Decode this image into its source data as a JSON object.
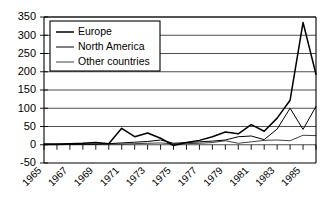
{
  "chart_data": {
    "type": "line",
    "title": "",
    "xlabel": "",
    "ylabel": "",
    "ylim": [
      -50,
      350
    ],
    "ytick_values": [
      -50,
      0,
      50,
      100,
      150,
      200,
      250,
      300,
      350
    ],
    "ytick_labels": [
      "-50",
      "0",
      "50",
      "100",
      "150",
      "200",
      "250",
      "300",
      "350"
    ],
    "grid": true,
    "legend_position": "upper left",
    "x": [
      1965,
      1966,
      1967,
      1968,
      1969,
      1970,
      1971,
      1972,
      1973,
      1974,
      1975,
      1976,
      1977,
      1978,
      1979,
      1980,
      1981,
      1982,
      1983,
      1984,
      1985,
      1986
    ],
    "xtick_labels": [
      "1965",
      "1967",
      "1969",
      "1971",
      "1973",
      "1975",
      "1977",
      "1979",
      "1981",
      "1983",
      "1985"
    ],
    "xtick_values": [
      1965,
      1967,
      1969,
      1971,
      1973,
      1975,
      1977,
      1979,
      1981,
      1983,
      1985
    ],
    "series": [
      {
        "name": "Europe",
        "values": [
          2,
          2,
          3,
          4,
          6,
          3,
          45,
          22,
          32,
          18,
          -2,
          6,
          12,
          22,
          35,
          30,
          55,
          37,
          73,
          122,
          335,
          193
        ]
      },
      {
        "name": "North America",
        "values": [
          1,
          1,
          1,
          2,
          2,
          3,
          5,
          7,
          9,
          13,
          4,
          6,
          8,
          10,
          13,
          22,
          24,
          14,
          43,
          100,
          42,
          105
        ]
      },
      {
        "name": "Other countries",
        "values": [
          0,
          0,
          1,
          1,
          1,
          2,
          2,
          3,
          4,
          5,
          2,
          3,
          4,
          6,
          11,
          4,
          8,
          12,
          13,
          11,
          26,
          25
        ]
      }
    ]
  },
  "legend": {
    "entries": [
      {
        "label": "Europe"
      },
      {
        "label": "North America"
      },
      {
        "label": "Other countries"
      }
    ]
  }
}
